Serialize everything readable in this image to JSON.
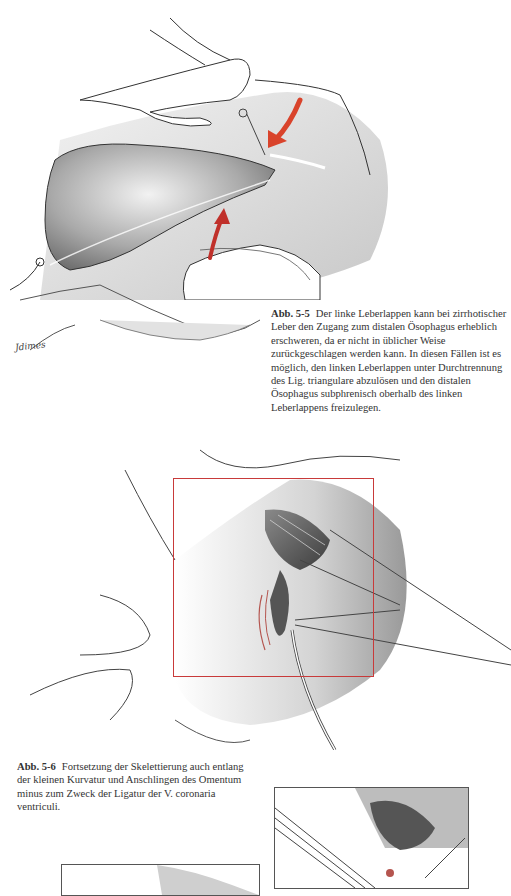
{
  "figures": [
    {
      "id_label": "Abb. 5-5",
      "caption": "Der linke Leberlappen kann bei zirrhotischer Leber den Zugang zum distalen Ösophagus erheblich erschweren, da er nicht in üblicher Weise zurückgeschlagen werden kann. In diesen Fällen ist es möglich, den linken Leberlappen unter Durchtrennung des Lig. triangulare abzulösen und den distalen Ösophagus subphrenisch oberhalb des linken Leberlappens freizulegen.",
      "artist_signature": "Jdimes"
    },
    {
      "id_label": "Abb. 5-6",
      "caption": "Fortsetzung der Skelettierung auch entlang der kleinen Kurvatur und Anschlingen des Omentum minus zum Zweck der Ligatur der V. coronaria ventriculi."
    }
  ],
  "colors": {
    "arrow_red": "#d9432b",
    "frame_red": "#c83a3a",
    "pencil": "#555555"
  }
}
